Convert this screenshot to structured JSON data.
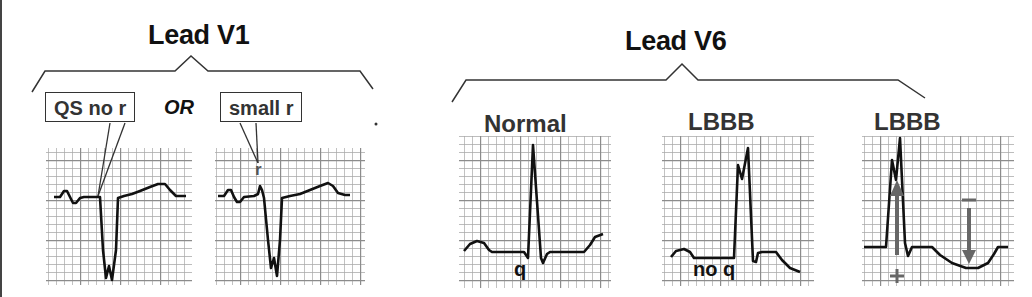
{
  "left_panel": {
    "title": "Lead V1",
    "callout_left": "QS no r",
    "or_label": "OR",
    "callout_right": "small r",
    "r_marker": "r"
  },
  "right_panel": {
    "title": "Lead V6",
    "panels": [
      {
        "label": "Normal",
        "annotation": "q"
      },
      {
        "label": "LBBB",
        "annotation": "no q"
      },
      {
        "label": "LBBB",
        "annotation_plus": "+",
        "annotation_minus": "−"
      }
    ]
  },
  "colors": {
    "grid": "#9a9a9a",
    "trace": "#111111",
    "arrow": "#666666",
    "text": "#111111"
  }
}
